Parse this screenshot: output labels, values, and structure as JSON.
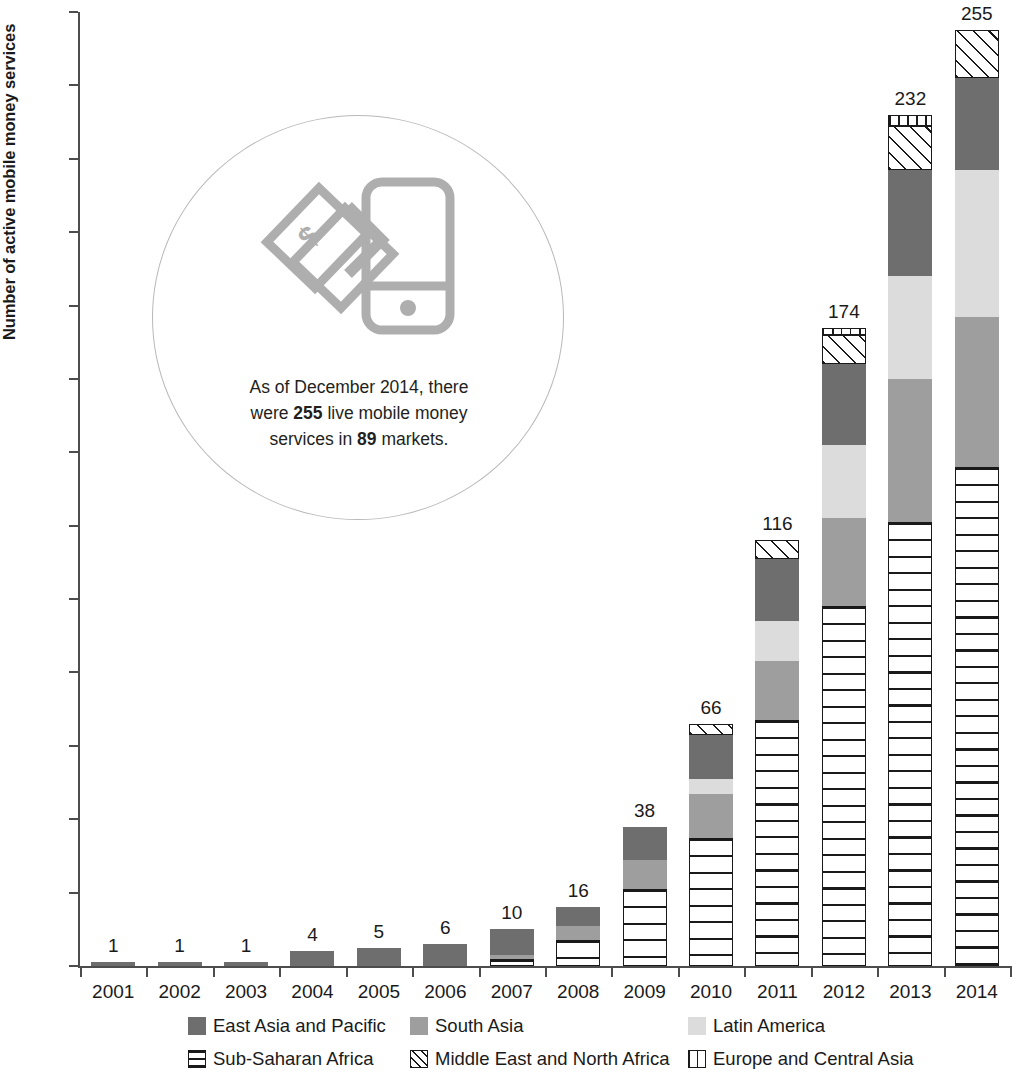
{
  "chart_data": {
    "type": "bar",
    "subtype": "stacked-bar",
    "title": "",
    "xlabel": "",
    "ylabel": "Number of active mobile money services",
    "ylim": [
      0,
      260
    ],
    "ytick_step": 20,
    "yticks": [
      0,
      20,
      40,
      60,
      80,
      100,
      120,
      140,
      160,
      180,
      200,
      220,
      240,
      260
    ],
    "grid": false,
    "legend_position": "bottom",
    "categories": [
      "2001",
      "2002",
      "2003",
      "2004",
      "2005",
      "2006",
      "2007",
      "2008",
      "2009",
      "2010",
      "2011",
      "2012",
      "2013",
      "2014"
    ],
    "totals": [
      1,
      1,
      1,
      4,
      5,
      6,
      10,
      16,
      38,
      66,
      116,
      174,
      232,
      255
    ],
    "series": [
      {
        "name": "Sub-Saharan Africa",
        "key": "ssa",
        "pattern": "horizontal-lines",
        "color": "#ffffff",
        "values": [
          0,
          0,
          0,
          0,
          0,
          0,
          2,
          7,
          21,
          35,
          67,
          98,
          121,
          136
        ]
      },
      {
        "name": "South Asia",
        "key": "sa",
        "pattern": "solid",
        "color": "#9e9e9e",
        "values": [
          0,
          0,
          0,
          0,
          0,
          0,
          1,
          4,
          8,
          12,
          16,
          24,
          39,
          41
        ]
      },
      {
        "name": "Latin America",
        "key": "lac",
        "pattern": "solid",
        "color": "#dcdcdc",
        "values": [
          0,
          0,
          0,
          0,
          0,
          0,
          0,
          0,
          0,
          4,
          11,
          20,
          28,
          40
        ]
      },
      {
        "name": "East Asia and Pacific",
        "key": "eap",
        "pattern": "solid",
        "color": "#6e6e6e",
        "values": [
          1,
          1,
          1,
          4,
          5,
          6,
          7,
          5,
          9,
          12,
          17,
          22,
          29,
          25
        ]
      },
      {
        "name": "Middle East and North Africa",
        "key": "mena",
        "pattern": "cross-hatch",
        "color": "#ffffff",
        "values": [
          0,
          0,
          0,
          0,
          0,
          0,
          0,
          0,
          0,
          3,
          5,
          8,
          12,
          13
        ]
      },
      {
        "name": "Europe and Central Asia",
        "key": "eca",
        "pattern": "grid",
        "color": "#ffffff",
        "values": [
          0,
          0,
          0,
          0,
          0,
          0,
          0,
          0,
          0,
          0,
          0,
          2,
          3,
          0
        ]
      }
    ]
  },
  "callout": {
    "text_line1_a": "As of December 2014, there",
    "text_line2_a": "were ",
    "text_line2_b": "255",
    "text_line2_c": " live mobile money",
    "text_line3_a": "services in ",
    "text_line3_b": "89",
    "text_line3_c": " markets.",
    "icon_name": "mobile-money-icon"
  },
  "colors": {
    "east_asia": "#6e6e6e",
    "south_asia": "#9e9e9e",
    "latin_america": "#dcdcdc",
    "axis": "#4d4d4d",
    "text": "#1a1a1a",
    "callout_ring": "#b9b9b9"
  }
}
